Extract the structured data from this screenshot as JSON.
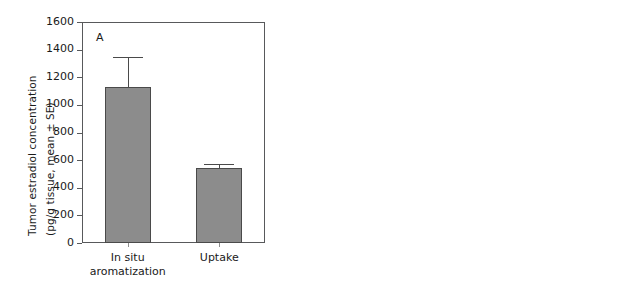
{
  "figure": {
    "background": "#ffffff",
    "bar_gray": "#8c8c8c",
    "bar_black": "#000000",
    "axis_color": "#58595b"
  },
  "chart_data": [
    {
      "type": "bar",
      "panel_label": "A",
      "title": "",
      "xlabel": "",
      "ylabel": "Tumor estradiol concentration (pg/g tissue, mean ± SE)",
      "ylabel_line1": "Tumor estradiol concentration",
      "ylabel_line2": "(pg/g tissue, mean ± SE)",
      "categories": [
        "In situ aromatization",
        "Uptake"
      ],
      "category_lines": [
        [
          "In situ",
          "aromatization"
        ],
        [
          "Uptake"
        ]
      ],
      "values": [
        1130,
        545
      ],
      "errors": [
        220,
        25
      ],
      "error_upper": [
        1350,
        570
      ],
      "ylim": [
        0,
        1600
      ],
      "yticks": [
        0,
        200,
        400,
        600,
        800,
        1000,
        1200,
        1400,
        1600
      ],
      "ytick_labels": [
        "0",
        "200",
        "400",
        "600",
        "800",
        "1000",
        "1200",
        "1400",
        "1600"
      ],
      "bar_color": "#8c8c8c",
      "grid": false,
      "legend": "none"
    },
    {
      "type": "bar",
      "panel_label": "B",
      "title": "",
      "xlabel": "",
      "ylabel": "Tumor weight (mg, mean ± SE)",
      "ylabel_line1": "Tumor weight (mg, mean ± SE)",
      "ylabel_line2": "",
      "categories": [
        "In situ aromatization",
        "Uptake"
      ],
      "category_lines": [
        [
          "In situ",
          "aromatization"
        ],
        [
          "Uptake"
        ]
      ],
      "values": [
        450,
        83
      ],
      "errors": [
        70,
        12
      ],
      "error_upper": [
        520,
        95
      ],
      "ylim": [
        0,
        600
      ],
      "yticks": [
        0,
        100,
        200,
        300,
        400,
        500,
        600
      ],
      "ytick_labels": [
        "0",
        "100",
        "200",
        "300",
        "400",
        "500",
        "600"
      ],
      "bar_color": "#000000",
      "grid": false,
      "legend": "none"
    }
  ]
}
